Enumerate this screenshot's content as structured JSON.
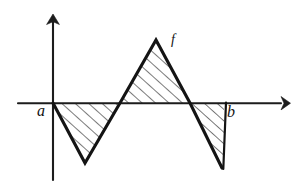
{
  "figure": {
    "background_color": "#ffffff",
    "ink_color": "#141414",
    "hatch_color": "#2a2a2a",
    "labels": {
      "a": "a",
      "b": "b",
      "f": "f"
    },
    "axes": {
      "x_axis_name": "x-axis",
      "y_axis_name": "y-axis",
      "x_axis_y_px": 103,
      "x_axis_x_start_px": 18,
      "x_axis_x_end_px": 285,
      "y_axis_x_px": 53,
      "y_axis_y_top_px": 14,
      "y_axis_y_bottom_px": 180,
      "arrow_heads": [
        "x-axis-right",
        "y-axis-up"
      ]
    }
  },
  "chart_data": {
    "type": "line",
    "title": "",
    "subtitle": "",
    "xlabel": "",
    "ylabel": "",
    "grid": false,
    "legend": false,
    "legend_position": "none",
    "series": [
      {
        "name": "f",
        "label": "f",
        "points_px": [
          [
            53,
            103
          ],
          [
            85,
            163
          ],
          [
            120,
            103
          ],
          [
            156,
            40
          ],
          [
            190,
            103
          ],
          [
            222,
            168
          ],
          [
            224,
            103
          ]
        ],
        "x_px": [
          53,
          85,
          120,
          156,
          190,
          222,
          224
        ],
        "y_px": [
          103,
          163,
          103,
          40,
          103,
          168,
          103
        ]
      }
    ],
    "annotations": [
      {
        "text": "a",
        "x_px": 41,
        "y_px": 111,
        "meaning": "left endpoint of interval on x-axis"
      },
      {
        "text": "b",
        "x_px": 231,
        "y_px": 112,
        "meaning": "right endpoint of interval on x-axis"
      },
      {
        "text": "f",
        "x_px": 175,
        "y_px": 41,
        "meaning": "name of the plotted function"
      }
    ],
    "shaded_regions": [
      {
        "name": "region-negative-left",
        "sign": "negative",
        "hatched": true,
        "hatch_direction": "lower-left-to-upper-right",
        "polygon_px": [
          [
            53,
            103
          ],
          [
            120,
            103
          ],
          [
            85,
            163
          ]
        ]
      },
      {
        "name": "region-positive-middle",
        "sign": "positive",
        "hatched": true,
        "hatch_direction": "lower-left-to-upper-right",
        "polygon_px": [
          [
            120,
            103
          ],
          [
            190,
            103
          ],
          [
            156,
            40
          ]
        ]
      },
      {
        "name": "region-negative-right",
        "sign": "negative",
        "hatched": true,
        "hatch_direction": "lower-left-to-upper-right",
        "polygon_px": [
          [
            190,
            103
          ],
          [
            224,
            103
          ],
          [
            224,
            170
          ],
          [
            222,
            168
          ]
        ]
      }
    ]
  }
}
